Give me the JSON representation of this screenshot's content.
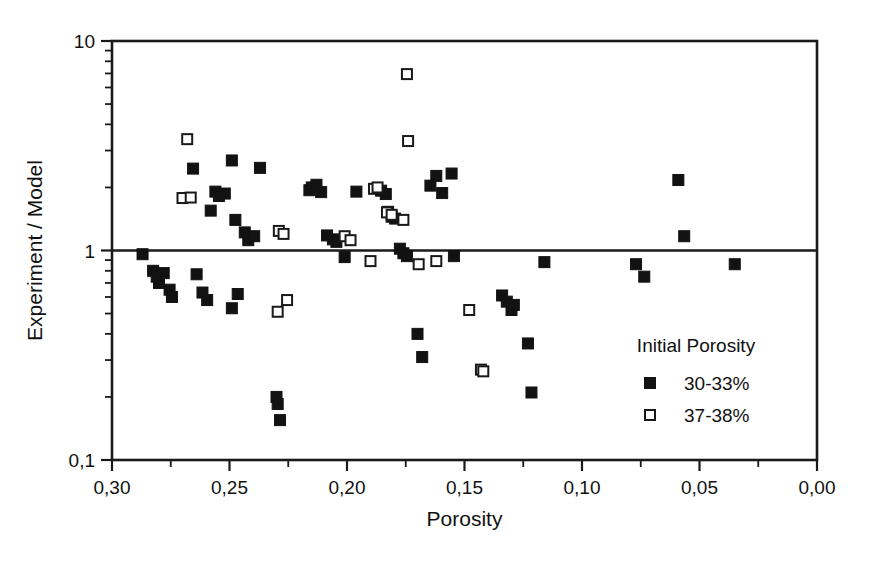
{
  "chart_data": {
    "type": "scatter",
    "title": "",
    "xlabel": "Porosity",
    "ylabel": "Experiment / Model",
    "xlim": [
      0.3,
      0.0
    ],
    "ylim": [
      0.1,
      10
    ],
    "yscale": "log",
    "xscale": "linear",
    "x_reversed": true,
    "grid": false,
    "reference_line_y": 1.0,
    "xticks": [
      "0,30",
      "0,25",
      "0,20",
      "0,15",
      "0,10",
      "0,05",
      "0,00"
    ],
    "xtick_values": [
      0.3,
      0.25,
      0.2,
      0.15,
      0.1,
      0.05,
      0.0
    ],
    "xminor_count": 1,
    "yticks": [
      "10",
      "1",
      "0,1"
    ],
    "ytick_values": [
      10,
      1,
      0.1
    ],
    "legend": {
      "title": "Initial Porosity",
      "position": "bottom-right",
      "entries": [
        {
          "label": "30-33%",
          "marker": "filled-square",
          "color": "#121212"
        },
        {
          "label": "37-38%",
          "marker": "open-square",
          "color": "#ffffff"
        }
      ]
    },
    "series": [
      {
        "name": "30-33%",
        "marker": "filled-square",
        "points": [
          [
            0.2655,
            2.46
          ],
          [
            0.258,
            1.55
          ],
          [
            0.256,
            1.91
          ],
          [
            0.2545,
            1.82
          ],
          [
            0.252,
            1.87
          ],
          [
            0.249,
            2.69
          ],
          [
            0.2475,
            1.4
          ],
          [
            0.2435,
            1.22
          ],
          [
            0.242,
            1.12
          ],
          [
            0.2395,
            1.17
          ],
          [
            0.237,
            2.48
          ],
          [
            0.287,
            0.96
          ],
          [
            0.2825,
            0.8
          ],
          [
            0.281,
            0.75
          ],
          [
            0.28,
            0.7
          ],
          [
            0.278,
            0.78
          ],
          [
            0.2755,
            0.65
          ],
          [
            0.2745,
            0.6
          ],
          [
            0.264,
            0.77
          ],
          [
            0.2615,
            0.63
          ],
          [
            0.2595,
            0.58
          ],
          [
            0.249,
            0.53
          ],
          [
            0.2465,
            0.62
          ],
          [
            0.23,
            0.2
          ],
          [
            0.2295,
            0.185
          ],
          [
            0.2285,
            0.155
          ],
          [
            0.216,
            1.94
          ],
          [
            0.215,
            2.0
          ],
          [
            0.213,
            2.06
          ],
          [
            0.211,
            1.9
          ],
          [
            0.2085,
            1.18
          ],
          [
            0.206,
            1.13
          ],
          [
            0.2045,
            1.1
          ],
          [
            0.201,
            0.93
          ],
          [
            0.196,
            1.91
          ],
          [
            0.1855,
            1.93
          ],
          [
            0.1835,
            1.86
          ],
          [
            0.1825,
            1.53
          ],
          [
            0.181,
            1.45
          ],
          [
            0.1795,
            1.42
          ],
          [
            0.1775,
            1.02
          ],
          [
            0.176,
            0.97
          ],
          [
            0.1745,
            0.94
          ],
          [
            0.17,
            0.4
          ],
          [
            0.168,
            0.31
          ],
          [
            0.1645,
            2.04
          ],
          [
            0.162,
            2.27
          ],
          [
            0.1595,
            1.88
          ],
          [
            0.1555,
            2.33
          ],
          [
            0.1545,
            0.94
          ],
          [
            0.134,
            0.61
          ],
          [
            0.132,
            0.57
          ],
          [
            0.13,
            0.52
          ],
          [
            0.129,
            0.55
          ],
          [
            0.123,
            0.36
          ],
          [
            0.1215,
            0.21
          ],
          [
            0.116,
            0.88
          ],
          [
            0.077,
            0.86
          ],
          [
            0.0735,
            0.75
          ],
          [
            0.059,
            2.17
          ],
          [
            0.0565,
            1.17
          ],
          [
            0.035,
            0.86
          ]
        ]
      },
      {
        "name": "37-38%",
        "marker": "open-square",
        "points": [
          [
            0.268,
            3.4
          ],
          [
            0.27,
            1.78
          ],
          [
            0.2665,
            1.79
          ],
          [
            0.229,
            1.24
          ],
          [
            0.227,
            1.2
          ],
          [
            0.2295,
            0.51
          ],
          [
            0.2255,
            0.58
          ],
          [
            0.201,
            1.17
          ],
          [
            0.1985,
            1.12
          ],
          [
            0.1745,
            6.95
          ],
          [
            0.174,
            3.33
          ],
          [
            0.1885,
            1.97
          ],
          [
            0.187,
            2.0
          ],
          [
            0.183,
            1.52
          ],
          [
            0.181,
            1.48
          ],
          [
            0.176,
            1.4
          ],
          [
            0.19,
            0.89
          ],
          [
            0.1695,
            0.86
          ],
          [
            0.162,
            0.89
          ],
          [
            0.148,
            0.52
          ],
          [
            0.143,
            0.27
          ],
          [
            0.142,
            0.265
          ]
        ]
      }
    ]
  },
  "axis": {
    "x_title": "Porosity",
    "y_title": "Experiment / Model"
  }
}
